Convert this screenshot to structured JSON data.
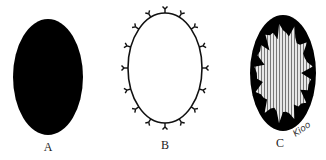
{
  "figure": {
    "panels": [
      {
        "id": "A",
        "label": "A",
        "style": "solid-black-ellipse",
        "cx": 48,
        "cy": 77,
        "rx": 35,
        "ry": 58,
        "label_pos": [
          48,
          140
        ]
      },
      {
        "id": "B",
        "label": "B",
        "style": "outlined-ellipse-with-spikes",
        "cx": 165,
        "cy": 68,
        "rx": 37,
        "ry": 55,
        "spike_count": 16,
        "label_pos": [
          165,
          138
        ]
      },
      {
        "id": "C",
        "label": "C",
        "style": "black-ellipse-with-hatched-core",
        "cx": 283,
        "cy": 73,
        "rx": 33,
        "ry": 58,
        "label_pos": [
          280,
          136
        ]
      }
    ],
    "annotation": {
      "text": "Kioo",
      "pos": [
        292,
        124
      ]
    },
    "colors": {
      "ink": "#000000",
      "hatch": "#bbbbbb",
      "background": "#ffffff"
    }
  }
}
